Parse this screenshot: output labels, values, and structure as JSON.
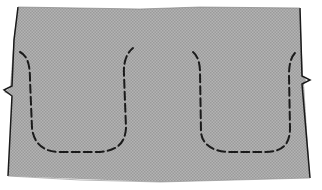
{
  "diagram": {
    "type": "sewing-pattern-piece",
    "colors": {
      "fabric_fill": "#a9a9a9",
      "outline": "#1a1a1a",
      "stitch_line": "#1a1a1a",
      "background": "#ffffff"
    },
    "pieces": [
      {
        "name": "fabric-panel",
        "notches": [
          "left-edge",
          "right-edge"
        ]
      }
    ],
    "stitch_lines": [
      {
        "name": "left-u-stitch",
        "style": "dashed"
      },
      {
        "name": "right-u-stitch",
        "style": "dashed"
      }
    ]
  }
}
